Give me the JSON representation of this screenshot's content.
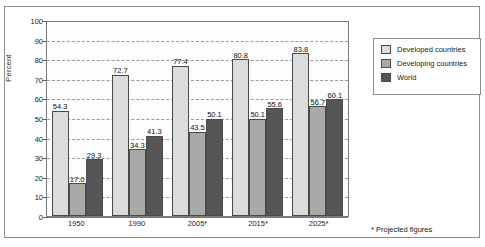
{
  "chart_data": {
    "type": "bar",
    "title": "",
    "subtitle": "",
    "xlabel": "",
    "ylabel": "Percent",
    "ylim": [
      0,
      100
    ],
    "ytick_step": 10,
    "yticks": [
      0,
      10,
      20,
      30,
      40,
      50,
      60,
      70,
      80,
      90,
      100
    ],
    "grid": true,
    "grid_style": "dashed-horizontal",
    "legend_position": "right",
    "categories": [
      "1950",
      "1990",
      "2005*",
      "2015*",
      "2025*"
    ],
    "series": [
      {
        "name": "Developed countries",
        "color": "#dcdcdc",
        "values": [
          54.3,
          72.7,
          77.4,
          80.8,
          83.8
        ],
        "labels": [
          "54.3",
          "72.7",
          "77.4",
          "80.8",
          "83.8"
        ]
      },
      {
        "name": "Developing countries",
        "color": "#a9a9a9",
        "values": [
          17.0,
          34.3,
          43.5,
          50.1,
          56.7
        ],
        "labels": [
          "17.0",
          "34.3",
          "43.5",
          "50.1",
          "56.7"
        ]
      },
      {
        "name": "World",
        "color": "#565656",
        "values": [
          29.3,
          41.3,
          50.1,
          55.6,
          60.1
        ],
        "labels": [
          "29.3",
          "41.3",
          "50.1",
          "55.6",
          "60.1"
        ]
      }
    ],
    "annotations": [
      "* Projected figures"
    ]
  },
  "legend": {
    "items": [
      {
        "label": "Developed countries",
        "swatch": "developed"
      },
      {
        "label": "Developing countries",
        "swatch": "developing"
      },
      {
        "label": "World",
        "swatch": "world"
      }
    ]
  },
  "footnote": "* Projected figures"
}
